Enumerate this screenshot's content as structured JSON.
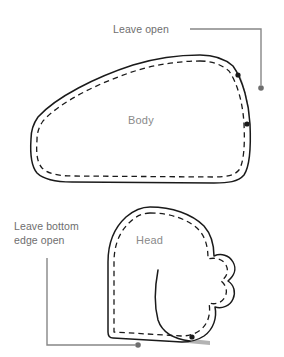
{
  "diagram": {
    "type": "sewing-pattern",
    "pieces": [
      {
        "id": "body",
        "label": "Body"
      },
      {
        "id": "head",
        "label": "Head"
      }
    ],
    "annotations": [
      {
        "id": "leave-open",
        "text": "Leave open",
        "line1": "Leave open",
        "line2": ""
      },
      {
        "id": "leave-bottom-edge-open",
        "text": "Leave bottom edge open",
        "line1": "Leave bottom",
        "line2": "edge open"
      }
    ],
    "colors": {
      "outline": "#1a1a1a",
      "stitch_dash": "#1a1a1a",
      "open_seam_fill": "#b3b3b3",
      "leader_line": "#878787",
      "marker_dot": "#1a1a1a",
      "piece_label_text": "#8a8a8a",
      "annotation_text": "#6e6e6e",
      "background": "#ffffff"
    },
    "icons": {
      "open_seam": "open-seam-band",
      "endpoint": "seam-endpoint-dot",
      "leader_terminal": "leader-terminal-dot"
    }
  }
}
